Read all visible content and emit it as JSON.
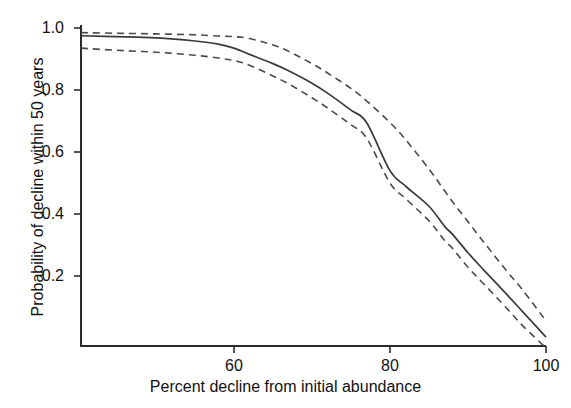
{
  "chart_data": {
    "type": "line",
    "title": "",
    "xlabel": "Percent decline from initial abundance",
    "ylabel": "Probability of decline within 50 years",
    "xlim": [
      40.4,
      100
    ],
    "ylim": [
      -0.03,
      1.03
    ],
    "xticks": [
      60,
      80,
      100
    ],
    "xticklabels": [
      "60",
      "80",
      "100"
    ],
    "yticks": [
      0.2,
      0.4,
      0.6,
      0.8,
      1.0
    ],
    "yticklabels": [
      "0.2",
      "0.4",
      "0.6",
      "0.8",
      "1.0"
    ],
    "grid": false,
    "legend": "none",
    "x": [
      40.4,
      45,
      50,
      55,
      58,
      60,
      62,
      65,
      67,
      70,
      72,
      75,
      77,
      80,
      82,
      85,
      87,
      88,
      90,
      92,
      95,
      97,
      100
    ],
    "series": [
      {
        "name": "Upper 95% confidence limit",
        "style": "dashed",
        "color": "#4a4a4a",
        "values": [
          0.985,
          0.983,
          0.981,
          0.978,
          0.974,
          0.972,
          0.966,
          0.945,
          0.925,
          0.885,
          0.855,
          0.805,
          0.765,
          0.695,
          0.64,
          0.545,
          0.475,
          0.44,
          0.375,
          0.31,
          0.215,
          0.155,
          0.055
        ]
      },
      {
        "name": "Estimated probability of decline",
        "style": "solid",
        "color": "#3a3a3a",
        "values": [
          0.975,
          0.972,
          0.968,
          0.958,
          0.948,
          0.935,
          0.915,
          0.885,
          0.862,
          0.822,
          0.79,
          0.735,
          0.695,
          0.54,
          0.49,
          0.425,
          0.36,
          0.335,
          0.275,
          0.22,
          0.14,
          0.085,
          0.003
        ]
      },
      {
        "name": "Lower 95% confidence limit",
        "style": "dashed",
        "color": "#4a4a4a",
        "values": [
          0.935,
          0.928,
          0.922,
          0.912,
          0.903,
          0.895,
          0.88,
          0.845,
          0.82,
          0.775,
          0.742,
          0.688,
          0.645,
          0.5,
          0.45,
          0.378,
          0.315,
          0.29,
          0.228,
          0.175,
          0.095,
          0.04,
          -0.032
        ]
      }
    ],
    "solid_values": [
      0.975,
      0.972,
      0.968,
      0.958,
      0.948,
      0.935,
      0.915,
      0.885,
      0.862,
      0.822,
      0.79,
      0.735,
      0.695,
      0.54,
      0.49,
      0.425,
      0.36,
      0.335,
      0.275,
      0.22,
      0.14,
      0.085,
      0.003
    ]
  },
  "axes": {
    "x_title": "Percent decline from initial abundance",
    "y_title": "Probability of decline within 50 years",
    "xticks": [
      {
        "label": "60"
      },
      {
        "label": "80"
      },
      {
        "label": "100"
      }
    ],
    "yticks": [
      {
        "label": "1.0"
      },
      {
        "label": "0.8"
      },
      {
        "label": "0.6"
      },
      {
        "label": "0.4"
      },
      {
        "label": "0.2"
      }
    ]
  },
  "style": {
    "axis_color": "#2b2b2b",
    "solid_line_color": "#3a3a3a",
    "dashed_line_color": "#4a4a4a",
    "background": "#ffffff"
  }
}
